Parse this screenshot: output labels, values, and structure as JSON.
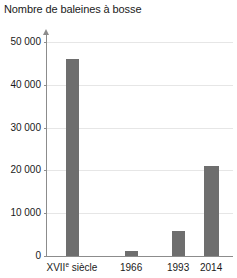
{
  "chart_data": {
    "type": "bar",
    "title": "Nombre de baleines à bosse",
    "xlabel": "",
    "ylabel": "",
    "categories": [
      "XVIIe siècle",
      "1966",
      "1993",
      "2014"
    ],
    "category_labels_main": [
      "XVII",
      "1966",
      "1993",
      "2014"
    ],
    "category_label_superscripts": [
      "e",
      "",
      "",
      ""
    ],
    "category_labels_suffix": [
      " siècle",
      "",
      "",
      ""
    ],
    "values": [
      46000,
      1200,
      5800,
      21000
    ],
    "ylim": [
      0,
      50000
    ],
    "ytick_values": [
      0,
      10000,
      20000,
      30000,
      40000,
      50000
    ],
    "ytick_labels": [
      "0",
      "10 000",
      "20 000",
      "30 000",
      "40 000",
      "50 000"
    ],
    "grid": true,
    "legend": false,
    "bar_color": "#6e6e6e",
    "gridline_color": "#e6e6e6",
    "axis_color": "#8c8c8c",
    "text_color": "#1a1a1a",
    "background_color": "#ffffff"
  }
}
